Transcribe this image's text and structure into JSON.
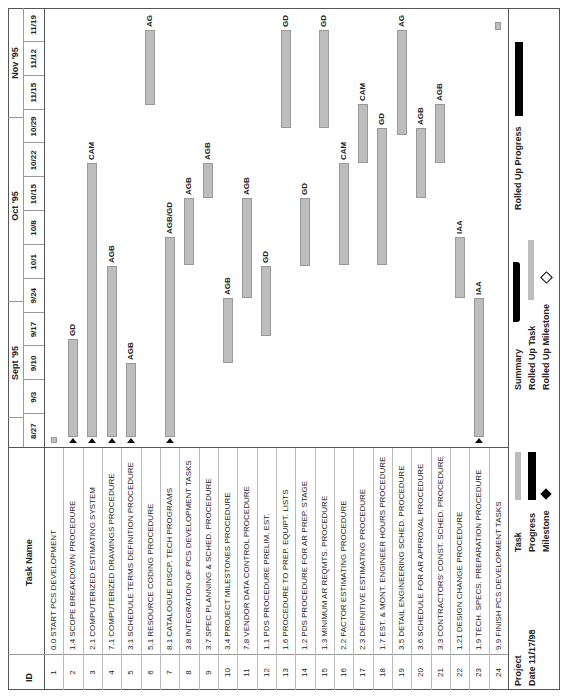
{
  "table": {
    "headers": {
      "id": "ID",
      "task_name": "Task Name"
    },
    "rows": [
      {
        "id": "1",
        "name": "0.0 START PCS DEVELOPMENT"
      },
      {
        "id": "2",
        "name": "1.4 SCOPE BREAKDOWN PROCEDURE"
      },
      {
        "id": "3",
        "name": "2.1 COMPUTERIZED ESTIMATING SYSTEM"
      },
      {
        "id": "4",
        "name": "7.1 COMPUTERIZED DRAWINGS PROCEDURE"
      },
      {
        "id": "5",
        "name": "3.1 SCHEDULE TERMS DEFINITION PROCEDURE"
      },
      {
        "id": "6",
        "name": "5.1 RESOURCE CODING PROCEDURE"
      },
      {
        "id": "7",
        "name": "8.1 CATALOGUE DISCP. TECH PROGRAMS"
      },
      {
        "id": "8",
        "name": "3.8 INTEGRATION OF PCS DEVELOPMENT TASKS"
      },
      {
        "id": "9",
        "name": "3.7 SPEC PLANNING & SCHED. PROCEDURE"
      },
      {
        "id": "10",
        "name": "3.4 PROJECT MILESTONES PROCEDURE"
      },
      {
        "id": "11",
        "name": "7.8 VENDOR DATA CONTROL PROCEDURE"
      },
      {
        "id": "12",
        "name": "1.1 PDS PROCEDURE PRELIM. EST."
      },
      {
        "id": "13",
        "name": "1.6 PROCEDURE TO PREP. EQUIPT. LISTS"
      },
      {
        "id": "14",
        "name": "1.2 PDS PROCEDURE FOR AR PREP. STAGE"
      },
      {
        "id": "15",
        "name": "1.3 MINIMUM AR REQMTS. PROCEDURE"
      },
      {
        "id": "16",
        "name": "2.2 FACTOR ESTIMATING PROCEDURE"
      },
      {
        "id": "17",
        "name": "2.3 DEFINITIVE ESTIMATING PROCEDURE"
      },
      {
        "id": "18",
        "name": "1.7 EST. & MONT. ENGINEER HOURS PROCEDURE"
      },
      {
        "id": "19",
        "name": "3.5 DETAIL ENGINEERING SCHED. PROCEDURE"
      },
      {
        "id": "20",
        "name": "3.6 SCHEDULE FOR AR APPROVAL PROCEDURE"
      },
      {
        "id": "21",
        "name": "3.3 CONTRACTORS' CONST. SCHED. PROCEDURE"
      },
      {
        "id": "22",
        "name": "1.21 DESIGN CHANGE PROCEDURE"
      },
      {
        "id": "23",
        "name": "1.9 TECH. SPECS. PREPARATION PROCEDURE"
      },
      {
        "id": "24",
        "name": "9.9 FINISH PCS DEVELOPMENT TASKS"
      }
    ]
  },
  "timeline": {
    "months": [
      {
        "label": "Sept '95"
      },
      {
        "label": "Oct '95"
      },
      {
        "label": "Nov '95"
      }
    ],
    "weeks": [
      "8/27",
      "9/3",
      "9/10",
      "9/17",
      "9/24",
      "10/1",
      "10/8",
      "10/15",
      "10/22",
      "10/29",
      "11/15",
      "11/12",
      "11/19"
    ]
  },
  "chart_data": {
    "type": "gantt",
    "title": "",
    "xlabel": "Timeline (weeks, 1995)",
    "ylabel": "Task Name",
    "categories": [
      "8/27",
      "9/3",
      "9/10",
      "9/17",
      "9/24",
      "10/1",
      "10/8",
      "10/15",
      "10/22",
      "10/29",
      "11/15",
      "11/12",
      "11/19"
    ],
    "tasks": [
      {
        "id": 1,
        "x0": 253,
        "x1": 259,
        "resource": ""
      },
      {
        "id": 2,
        "x0": 259,
        "x1": 357,
        "resource": "GD"
      },
      {
        "id": 3,
        "x0": 259,
        "x1": 533,
        "resource": "CAM"
      },
      {
        "id": 4,
        "x0": 259,
        "x1": 430,
        "resource": "AGB"
      },
      {
        "id": 5,
        "x0": 259,
        "x1": 333,
        "resource": "AGB"
      },
      {
        "id": 6,
        "x0": 591,
        "x1": 666,
        "resource": "AG"
      },
      {
        "id": 7,
        "x0": 259,
        "x1": 459,
        "resource": "AGB/GD"
      },
      {
        "id": 8,
        "x0": 431,
        "x1": 498,
        "resource": "AGB"
      },
      {
        "id": 9,
        "x0": 498,
        "x1": 533,
        "resource": "AGB"
      },
      {
        "id": 10,
        "x0": 333,
        "x1": 398,
        "resource": "AGB"
      },
      {
        "id": 11,
        "x0": 398,
        "x1": 498,
        "resource": "AGB"
      },
      {
        "id": 12,
        "x0": 360,
        "x1": 430,
        "resource": "GD"
      },
      {
        "id": 13,
        "x0": 568,
        "x1": 666,
        "resource": "GD"
      },
      {
        "id": 14,
        "x0": 430,
        "x1": 498,
        "resource": "GD"
      },
      {
        "id": 15,
        "x0": 568,
        "x1": 666,
        "resource": "GD"
      },
      {
        "id": 16,
        "x0": 431,
        "x1": 533,
        "resource": "CAM"
      },
      {
        "id": 17,
        "x0": 533,
        "x1": 592,
        "resource": "CAM"
      },
      {
        "id": 18,
        "x0": 431,
        "x1": 568,
        "resource": "GD"
      },
      {
        "id": 19,
        "x0": 561,
        "x1": 666,
        "resource": "AG"
      },
      {
        "id": 20,
        "x0": 498,
        "x1": 568,
        "resource": "AGB"
      },
      {
        "id": 21,
        "x0": 533,
        "x1": 592,
        "resource": "AGB"
      },
      {
        "id": 22,
        "x0": 398,
        "x1": 459,
        "resource": "IAA"
      },
      {
        "id": 23,
        "x0": 259,
        "x1": 398,
        "resource": "IAA"
      },
      {
        "id": 24,
        "x0": 666,
        "x1": 674,
        "resource": ""
      }
    ]
  },
  "legend": {
    "project_label": "Project",
    "date_label": "Date 11/17/98",
    "task": "Task",
    "progress": "Progress",
    "milestone": "Milestone",
    "summary": "Summary",
    "rolled_up_task": "Rolled Up Task",
    "rolled_up_milestone": "Rolled Up Milestone",
    "rolled_up_progress": "Rolled Up Progress"
  },
  "colors": {
    "bar": "#bdbdbd",
    "progress": "#000000",
    "grid": "#999999"
  }
}
